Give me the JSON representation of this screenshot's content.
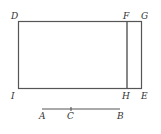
{
  "diagram": {
    "labels": {
      "D": "D",
      "F": "F",
      "G": "G",
      "I": "I",
      "H": "H",
      "E": "E",
      "A": "A",
      "C": "C",
      "B": "B"
    },
    "colors": {
      "stroke": "#555555",
      "text": "#333333",
      "background": "#ffffff"
    }
  }
}
